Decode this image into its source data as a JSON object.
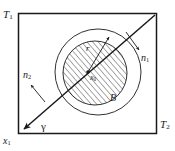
{
  "figure": {
    "caption": "Square domain with concentric circles and an oblique line",
    "colors": {
      "stroke": "#1a1a1a",
      "hatch": "#1a1a1a",
      "background": "#ffffff"
    },
    "frame": {
      "name": "square-boundary",
      "x": 18,
      "y": 13,
      "width": 139,
      "height": 121
    },
    "labels": {
      "top_left_boundary": "T",
      "top_left_boundary_sub": "1",
      "bottom_right_boundary": "T",
      "bottom_right_boundary_sub": "2",
      "origin_axis": "x",
      "origin_axis_sub": "1",
      "normal_right": "n",
      "normal_right_sub": "1",
      "normal_left": "n",
      "normal_left_sub": "2",
      "interface_line": "γ",
      "radius": "r",
      "center_point": "x",
      "center_point_sub": "0",
      "hatched_region": "B"
    },
    "geometry": {
      "outer_circle": {
        "cx": 98,
        "cy": 72,
        "r": 43
      },
      "inner_circle": {
        "cx": 95,
        "cy": 73,
        "r": 32
      },
      "center_dot": {
        "cx": 88,
        "cy": 72,
        "r": 1.6
      },
      "diagonal_line": {
        "x1": 22,
        "y1": 131,
        "x2": 155,
        "y2": 15
      },
      "radius_arrow": {
        "x1": 88,
        "y1": 72,
        "x2": 110,
        "y2": 36
      },
      "normal_right_arrow": {
        "x1": 127,
        "y1": 33,
        "x2": 140,
        "y2": 50
      },
      "normal_left_arrow": {
        "x1": 44,
        "y1": 101,
        "x2": 30,
        "y2": 84
      },
      "gamma_arrowhead_at": "bottom-left-corner"
    }
  }
}
